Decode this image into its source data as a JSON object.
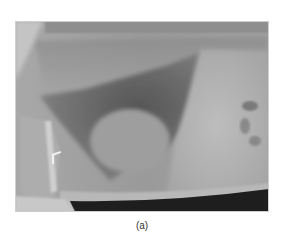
{
  "figure": {
    "type": "radiograph",
    "caption": "(a)",
    "colors": {
      "background": "#9a9a9a",
      "lung_dark": "#5a5a5a",
      "soft_tissue": "#b4b4b4",
      "air_below": "#1e1e1e",
      "marker": "#f2f2f2"
    }
  }
}
